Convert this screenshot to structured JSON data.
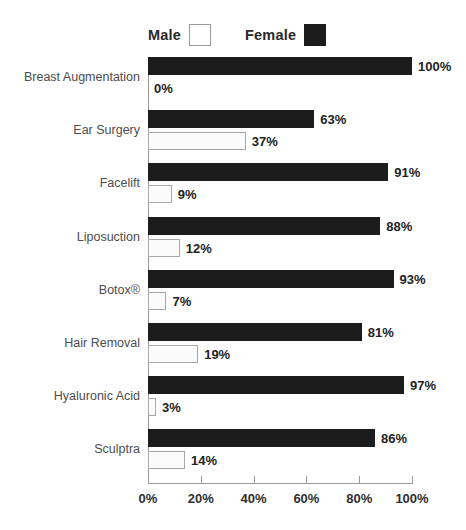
{
  "legend": {
    "items": [
      {
        "label": "Male",
        "swatch": "male-swatch",
        "color": "#ffffff"
      },
      {
        "label": "Female",
        "swatch": "female-swatch",
        "color": "#1c1c1c"
      }
    ]
  },
  "axis": {
    "x_ticks": [
      "0%",
      "20%",
      "40%",
      "60%",
      "80%",
      "100%"
    ],
    "x_tick_values": [
      0,
      20,
      40,
      60,
      80,
      100
    ]
  },
  "chart_data": {
    "type": "bar",
    "orientation": "horizontal",
    "title": "",
    "subtitle": "",
    "xlabel": "",
    "ylabel": "",
    "xlim": [
      0,
      100
    ],
    "grid": false,
    "legend_position": "top-left",
    "value_suffix": "%",
    "categories": [
      "Breast Augmentation",
      "Ear Surgery",
      "Facelift",
      "Liposuction",
      "Botox®",
      "Hair Removal",
      "Hyaluronic Acid",
      "Sculptra"
    ],
    "series": [
      {
        "name": "Female",
        "color": "#1c1c1c",
        "values": [
          100,
          63,
          91,
          88,
          93,
          81,
          97,
          86
        ],
        "labels": [
          "100%",
          "63%",
          "91%",
          "88%",
          "93%",
          "81%",
          "97%",
          "86%"
        ]
      },
      {
        "name": "Male",
        "color": "#ffffff",
        "values": [
          0,
          37,
          9,
          12,
          7,
          19,
          3,
          14
        ],
        "labels": [
          "0%",
          "37%",
          "9%",
          "12%",
          "7%",
          "19%",
          "3%",
          "14%"
        ]
      }
    ]
  }
}
